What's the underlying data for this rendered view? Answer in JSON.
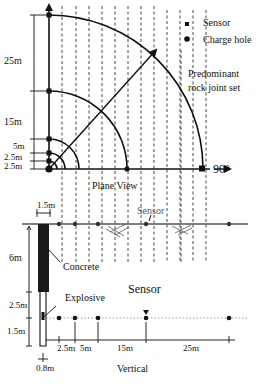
{
  "plan_view": {
    "title": "Plane View",
    "direction_label": "90°",
    "north_label": "0°",
    "legend": {
      "sensor_label": "Sensor",
      "charge_hole_label": "Charge hole",
      "joint_label_line1": "Predominant",
      "joint_label_line2": "rock joint set"
    },
    "distances": [
      "25m",
      "15m",
      "5m",
      "2.5m",
      "2.5m"
    ],
    "colors": {
      "line": "#111111",
      "dashed": "#333333"
    }
  },
  "vertical_view": {
    "title": "Vertical",
    "top_width_label": "1.5m",
    "depth_labels": [
      "6m",
      "2.5m",
      "1.5m"
    ],
    "bottom_width_label": "0.8m",
    "concrete_label": "Concrete",
    "explosive_label": "Explosive",
    "surface_sensor_label": "Sensor",
    "depth_sensor_label": "Sensor",
    "horizontal_distances": [
      "2.5m",
      "5m",
      "15m",
      "25m"
    ],
    "colors": {
      "concrete": "#1a1a1a",
      "surface": "#555555"
    }
  },
  "caption": ""
}
